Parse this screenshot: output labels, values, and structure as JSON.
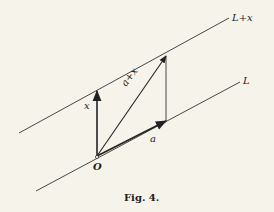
{
  "figure": {
    "caption": "Fig. 4.",
    "lines": {
      "upper_label": "L+x",
      "lower_label": "L"
    },
    "vectors": {
      "x_label": "x",
      "a_label": "a",
      "sum_label": "a+x"
    },
    "origin_label": "O",
    "colors": {
      "background": "#f6f4ea",
      "ink": "#222222"
    }
  }
}
